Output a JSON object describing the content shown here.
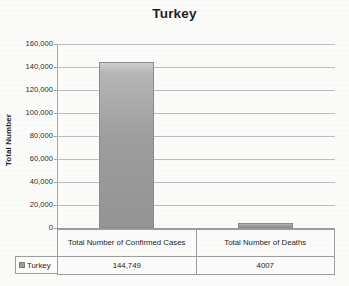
{
  "chart_data": {
    "type": "bar",
    "title": "Turkey",
    "xlabel": "",
    "ylabel": "Total Number",
    "categories": [
      "Total Number of Confirmed Cases",
      "Total Number of Deaths"
    ],
    "values": [
      144749,
      4007
    ],
    "value_labels": [
      "144,749",
      "4007"
    ],
    "series": [
      {
        "name": "Turkey",
        "values": [
          144749,
          4007
        ],
        "color": "#9e9e9e"
      }
    ],
    "ylim": [
      0,
      160000
    ],
    "ytick_interval": 20000,
    "ytick_labels": [
      "160,000",
      "140,000",
      "120,000",
      "100,000",
      "80,000",
      "60,000",
      "40,000",
      "20,000",
      "0"
    ],
    "ytick_values": [
      160000,
      140000,
      120000,
      100000,
      80000,
      60000,
      40000,
      20000,
      0
    ],
    "grid": true,
    "legend_position": "data-table-left",
    "legend_entries": [
      "Turkey"
    ],
    "data_table": {
      "show": true,
      "row_header": "Turkey",
      "columns": [
        "Total Number of Confirmed Cases",
        "Total Number of Deaths"
      ],
      "row_values": [
        "144,749",
        "4007"
      ]
    }
  },
  "colors": {
    "bar_fill": "#9e9e9e",
    "bar_border": "#8a8a8a",
    "gridline": "#bcbcbc",
    "axis": "#a6a6a6",
    "text": "#242424",
    "background": "#fbfbf9"
  }
}
